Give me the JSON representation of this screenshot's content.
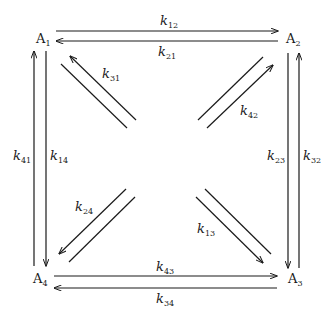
{
  "diagram": {
    "type": "compartment-rate-diagram",
    "nodes": [
      {
        "id": "A1",
        "base": "A",
        "sub": "1",
        "position": "top-left"
      },
      {
        "id": "A2",
        "base": "A",
        "sub": "2",
        "position": "top-right"
      },
      {
        "id": "A3",
        "base": "A",
        "sub": "3",
        "position": "bottom-right"
      },
      {
        "id": "A4",
        "base": "A",
        "sub": "4",
        "position": "bottom-left"
      }
    ],
    "edges": [
      {
        "from": "A1",
        "to": "A2",
        "base": "k",
        "sub": "12"
      },
      {
        "from": "A2",
        "to": "A1",
        "base": "k",
        "sub": "21"
      },
      {
        "from": "A2",
        "to": "A3",
        "base": "k",
        "sub": "23"
      },
      {
        "from": "A3",
        "to": "A2",
        "base": "k",
        "sub": "32"
      },
      {
        "from": "A4",
        "to": "A3",
        "base": "k",
        "sub": "43"
      },
      {
        "from": "A3",
        "to": "A4",
        "base": "k",
        "sub": "34"
      },
      {
        "from": "A1",
        "to": "A4",
        "base": "k",
        "sub": "14"
      },
      {
        "from": "A4",
        "to": "A1",
        "base": "k",
        "sub": "41"
      },
      {
        "from": "A3",
        "to": "A1",
        "base": "k",
        "sub": "31"
      },
      {
        "from": "A4",
        "to": "A2",
        "base": "k",
        "sub": "42"
      },
      {
        "from": "A1",
        "to": "A3",
        "base": "k",
        "sub": "13"
      },
      {
        "from": "A2",
        "to": "A4",
        "base": "k",
        "sub": "24"
      }
    ]
  }
}
